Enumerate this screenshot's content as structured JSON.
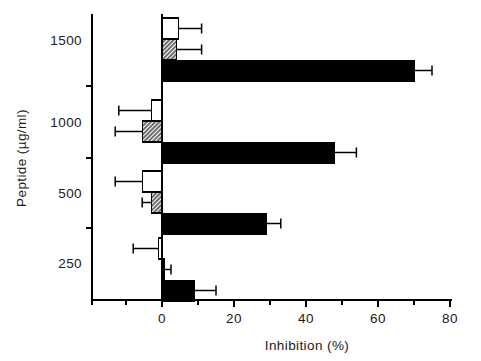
{
  "chart_data": {
    "type": "bar",
    "orientation": "horizontal",
    "title": "",
    "xlabel": "Inhibition  (%)",
    "ylabel": "Peptide  (µg/ml)",
    "xlim": [
      -20,
      80
    ],
    "xticks": [
      0,
      20,
      40,
      60,
      80
    ],
    "xtick_labels": [
      "0",
      "20",
      "40",
      "60",
      "80"
    ],
    "xminor_ticks": [
      -10,
      10,
      30,
      50,
      70
    ],
    "grid": false,
    "legend": "none",
    "categories": [
      "250",
      "500",
      "1000",
      "1500"
    ],
    "ytick_labels": [
      "1500",
      "1000",
      "500",
      "250"
    ],
    "series": [
      {
        "name": "open",
        "style": "white-open",
        "values": [
          -1.0,
          -5.5,
          -3.0,
          4.5
        ],
        "errors_outer": [
          -8.0,
          -13.0,
          -12.0,
          11.0
        ]
      },
      {
        "name": "hatched",
        "style": "hatched",
        "values": [
          0.5,
          -3.0,
          -5.5,
          4.0
        ],
        "errors_outer": [
          2.5,
          -5.5,
          -13.0,
          11.0
        ]
      },
      {
        "name": "solid",
        "style": "black-solid",
        "values": [
          9.0,
          29.0,
          48.0,
          70.0
        ],
        "errors_outer": [
          15.0,
          33.0,
          54.0,
          75.0
        ]
      }
    ]
  },
  "axis": {
    "x_title": "Inhibition  (%)",
    "y_title": "Peptide  (µg/ml)",
    "x_tick_0": "0",
    "x_tick_1": "20",
    "x_tick_2": "40",
    "x_tick_3": "60",
    "x_tick_4": "80",
    "y_tick_0": "1500",
    "y_tick_1": "1000",
    "y_tick_2": "500",
    "y_tick_3": "250"
  },
  "colors": {
    "ink": "#000000",
    "background": "#ffffff",
    "solid_bar": "#000000",
    "open_bar": "#ffffff",
    "hatch_bar": "#9a9a9a"
  }
}
